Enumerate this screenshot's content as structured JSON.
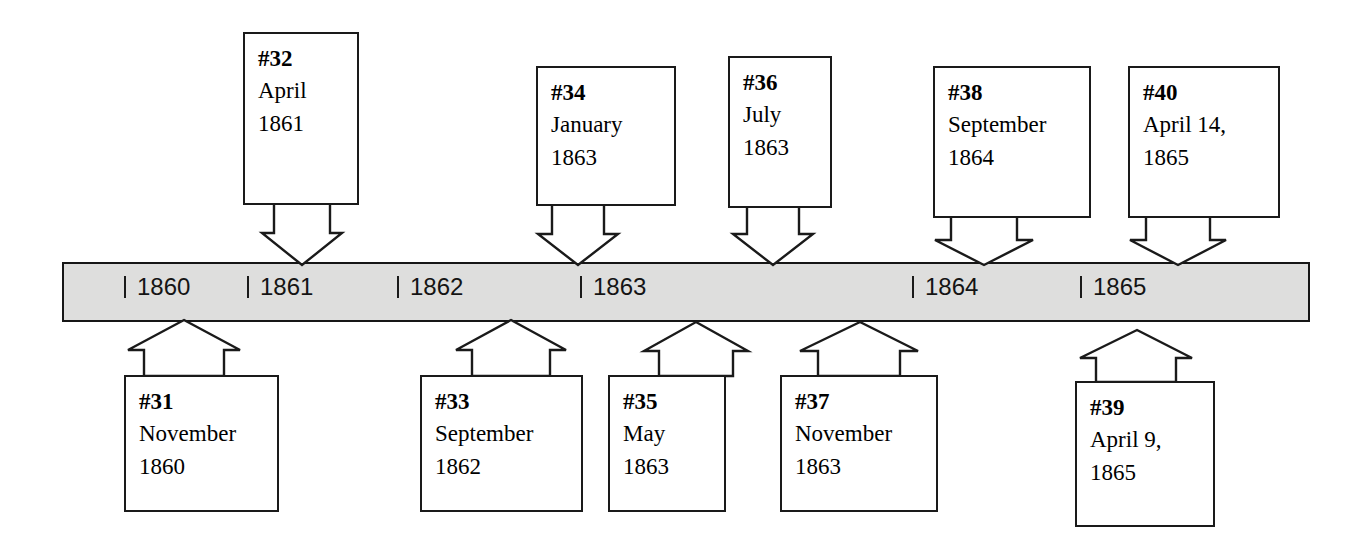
{
  "diagram": {
    "type": "timeline",
    "bar": {
      "fill_color": "#dededd",
      "border_color": "#161616",
      "years": [
        {
          "label": "1860"
        },
        {
          "label": "1861"
        },
        {
          "label": "1862"
        },
        {
          "label": "1863"
        },
        {
          "label": "1864"
        },
        {
          "label": "1865"
        }
      ]
    },
    "events_above": [
      {
        "number": "#32",
        "line1": "April",
        "line2": "1861"
      },
      {
        "number": "#34",
        "line1": "January",
        "line2": "1863"
      },
      {
        "number": "#36",
        "line1": "July",
        "line2": "1863"
      },
      {
        "number": "#38",
        "line1": "September",
        "line2": "1864"
      },
      {
        "number": "#40",
        "line1": "April 14,",
        "line2": "1865"
      }
    ],
    "events_below": [
      {
        "number": "#31",
        "line1": "November",
        "line2": "1860"
      },
      {
        "number": "#33",
        "line1": "September",
        "line2": "1862"
      },
      {
        "number": "#35",
        "line1": "May",
        "line2": "1863"
      },
      {
        "number": "#37",
        "line1": "November",
        "line2": "1863"
      },
      {
        "number": "#39",
        "line1": "April 9,",
        "line2": "1865"
      }
    ]
  }
}
